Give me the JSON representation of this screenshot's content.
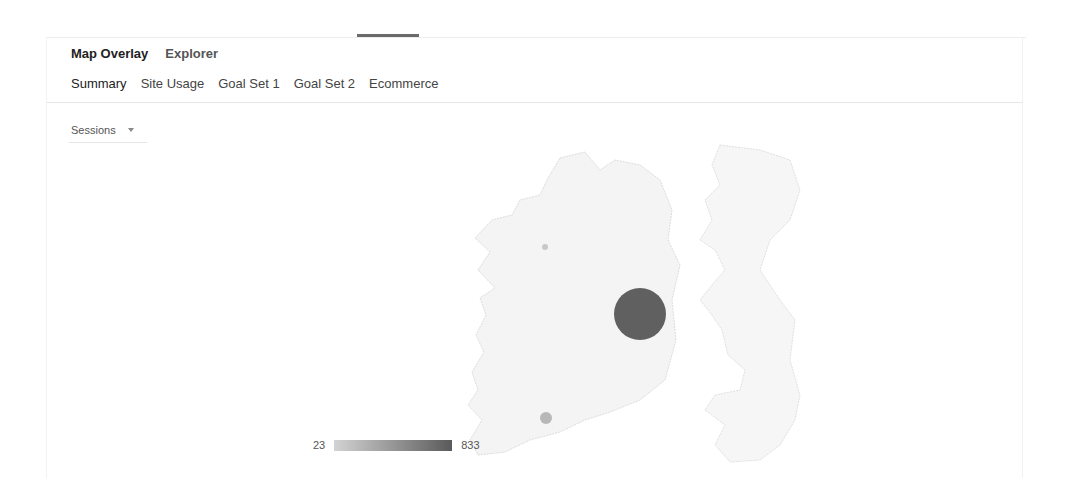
{
  "view_tabs": [
    {
      "label": "Map Overlay",
      "active": true
    },
    {
      "label": "Explorer",
      "active": false
    }
  ],
  "sub_tabs": [
    {
      "label": "Summary",
      "active": true
    },
    {
      "label": "Site Usage",
      "active": false
    },
    {
      "label": "Goal Set 1",
      "active": false
    },
    {
      "label": "Goal Set 2",
      "active": false
    },
    {
      "label": "Ecommerce",
      "active": false
    }
  ],
  "metric_select": {
    "selected": "Sessions",
    "icon": "chevron-down-icon"
  },
  "map": {
    "region": "Ireland",
    "bubbles": [
      {
        "name": "Dublin",
        "cx": 640,
        "cy": 314,
        "r": 26,
        "color": "#606060"
      },
      {
        "name": "Cork",
        "cx": 546,
        "cy": 418,
        "r": 6,
        "color": "#b8b8b8"
      },
      {
        "name": "Galway",
        "cx": 545,
        "cy": 247,
        "r": 3,
        "color": "#c8c8c8"
      }
    ]
  },
  "legend": {
    "min": "23",
    "max": "833",
    "color_min": "#d3d3d3",
    "color_max": "#5a5a5a"
  }
}
